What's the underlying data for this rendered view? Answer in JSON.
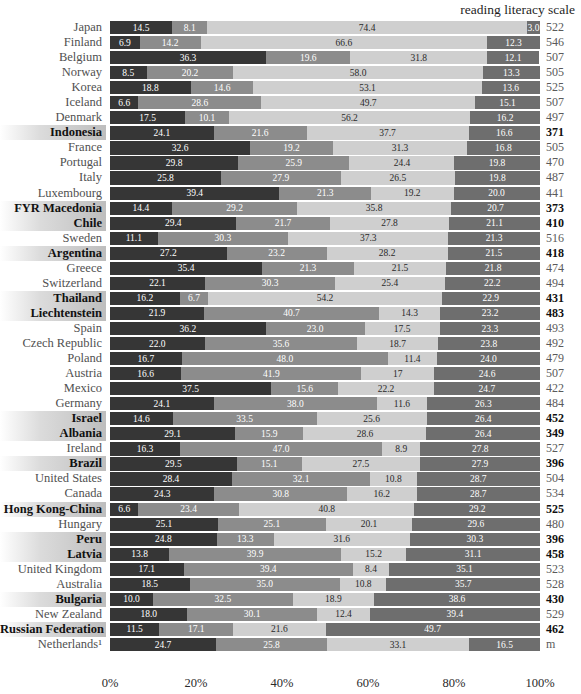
{
  "header": {
    "clipped_top_line": "————————",
    "scale_caption": "reading literacy scale"
  },
  "axis": {
    "ticks": [
      "0%",
      "20%",
      "40%",
      "60%",
      "80%",
      "100%"
    ],
    "tick_positions": [
      0,
      20,
      40,
      60,
      80,
      100
    ]
  },
  "colors": {
    "segment_1": "#363636",
    "segment_2": "#8c8c8c",
    "segment_3": "#cfcfcf",
    "segment_4": "#6e6e6e",
    "highlight_background": "#b2b2b2",
    "label_text": "#505050",
    "score_text": "#5a5a5a"
  },
  "chart_data": {
    "type": "bar",
    "subtype": "stacked-horizontal-100percent",
    "title": "",
    "xlabel": "",
    "ylabel": "",
    "xlim": [
      0,
      100
    ],
    "grid": true,
    "legend_position": "none",
    "categories": [
      "Japan",
      "Finland",
      "Belgium",
      "Norway",
      "Korea",
      "Iceland",
      "Denmark",
      "Indonesia",
      "France",
      "Portugal",
      "Italy",
      "Luxembourg",
      "FYR Macedonia",
      "Chile",
      "Sweden",
      "Argentina",
      "Greece",
      "Switzerland",
      "Thailand",
      "Liechtenstein",
      "Spain",
      "Czech Republic",
      "Poland",
      "Austria",
      "Mexico",
      "Germany",
      "Israel",
      "Albania",
      "Ireland",
      "Brazil",
      "United States",
      "Canada",
      "Hong Kong-China",
      "Hungary",
      "Peru",
      "Latvia",
      "United Kingdom",
      "Australia",
      "Bulgaria",
      "New Zealand",
      "Russian Federation",
      "Netherlands¹"
    ],
    "series": [
      {
        "name": "segment-1",
        "values": [
          14.5,
          6.9,
          36.3,
          8.5,
          18.8,
          6.6,
          17.5,
          24.1,
          32.6,
          29.8,
          25.8,
          39.4,
          14.4,
          29.4,
          11.1,
          27.2,
          35.4,
          22.1,
          16.2,
          21.9,
          36.2,
          22.0,
          16.7,
          16.6,
          37.5,
          24.1,
          14.6,
          29.1,
          16.3,
          29.5,
          28.4,
          24.3,
          6.6,
          25.1,
          24.8,
          13.8,
          17.1,
          18.5,
          10.0,
          18.0,
          11.5,
          24.7
        ]
      },
      {
        "name": "segment-2",
        "values": [
          8.1,
          14.2,
          19.6,
          20.2,
          14.6,
          28.6,
          10.1,
          21.6,
          19.2,
          25.9,
          27.9,
          21.3,
          29.2,
          21.7,
          30.3,
          23.2,
          21.3,
          30.3,
          6.7,
          40.7,
          23.0,
          35.6,
          48.0,
          41.9,
          15.6,
          38.0,
          33.5,
          15.9,
          47.0,
          15.1,
          32.1,
          30.8,
          23.4,
          25.1,
          13.3,
          39.9,
          39.4,
          35.0,
          32.5,
          30.1,
          17.1,
          25.8
        ]
      },
      {
        "name": "segment-3",
        "values": [
          74.4,
          66.6,
          31.8,
          58.0,
          53.1,
          49.7,
          56.2,
          37.7,
          31.3,
          24.4,
          26.5,
          19.2,
          35.8,
          27.8,
          37.3,
          28.2,
          21.5,
          25.4,
          54.2,
          14.3,
          17.5,
          18.7,
          11.4,
          17,
          22.2,
          11.6,
          25.6,
          28.6,
          8.9,
          27.5,
          10.8,
          16.2,
          40.8,
          20.1,
          31.6,
          15.2,
          8.4,
          10.8,
          18.9,
          12.4,
          21.6,
          33.1
        ]
      },
      {
        "name": "segment-4",
        "values": [
          3.0,
          12.3,
          12.1,
          13.3,
          13.6,
          15.1,
          16.2,
          16.6,
          16.8,
          19.8,
          19.8,
          20.0,
          20.7,
          21.1,
          21.3,
          21.5,
          21.8,
          22.2,
          22.9,
          23.2,
          23.3,
          23.8,
          24.0,
          24.6,
          24.7,
          26.3,
          26.4,
          26.4,
          27.8,
          27.9,
          28.7,
          28.7,
          29.2,
          29.6,
          30.3,
          31.1,
          35.1,
          35.7,
          38.6,
          39.4,
          49.7,
          16.5
        ]
      }
    ],
    "display_labels": {
      "segment_1": [
        "14.5",
        "6.9",
        "36.3",
        "8.5",
        "18.8",
        "6.6",
        "17.5",
        "24.1",
        "32.6",
        "29.8",
        "25.8",
        "39.4",
        "14.4",
        "29.4",
        "11.1",
        "27.2",
        "35.4",
        "22.1",
        "16.2",
        "21.9",
        "36.2",
        "22.0",
        "16.7",
        "16.6",
        "37.5",
        "24.1",
        "14.6",
        "29.1",
        "16.3",
        "29.5",
        "28.4",
        "24.3",
        "6.6",
        "25.1",
        "24.8",
        "13.8",
        "17.1",
        "18.5",
        "10.0",
        "18.0",
        "11.5",
        "24.7"
      ],
      "segment_2": [
        "8.1",
        "14.2",
        "19.6",
        "20.2",
        "14.6",
        "28.6",
        "10.1",
        "21.6",
        "19.2",
        "25.9",
        "27.9",
        "21.3",
        "29.2",
        "21.7",
        "30.3",
        "23.2",
        "21.3",
        "30.3",
        "6.7",
        "40.7",
        "23.0",
        "35.6",
        "48.0",
        "41.9",
        "15.6",
        "38.0",
        "33.5",
        "15.9",
        "47.0",
        "15.1",
        "32.1",
        "30.8",
        "23.4",
        "25.1",
        "13.3",
        "39.9",
        "39.4",
        "35.0",
        "32.5",
        "30.1",
        "17.1",
        "25.8"
      ],
      "segment_3": [
        "74.4",
        "66.6",
        "31.8",
        "58.0",
        "53.1",
        "49.7",
        "56.2",
        "37.7",
        "31.3",
        "24.4",
        "26.5",
        "19.2",
        "35.8",
        "27.8",
        "37.3",
        "28.2",
        "21.5",
        "25.4",
        "54.2",
        "14.3",
        "17.5",
        "18.7",
        "11.4",
        "17",
        "22.2",
        "11.6",
        "25.6",
        "28.6",
        "8.9",
        "27.5",
        "10.8",
        "16.2",
        "40.8",
        "20.1",
        "31.6",
        "15.2",
        "8.4",
        "10.8",
        "18.9",
        "12.4",
        "21.6",
        "33.1"
      ],
      "segment_4": [
        "3.0",
        "12.3",
        "12.1",
        "13.3",
        "13.6",
        "15.1",
        "16.2",
        "16.6",
        "16.8",
        "19.8",
        "19.8",
        "20.0",
        "20.7",
        "21.1",
        "21.3",
        "21.5",
        "21.8",
        "22.2",
        "22.9",
        "23.2",
        "23.3",
        "23.8",
        "24.0",
        "24.6",
        "24.7",
        "26.3",
        "26.4",
        "26.4",
        "27.8",
        "27.9",
        "28.7",
        "28.7",
        "29.2",
        "29.6",
        "30.3",
        "31.1",
        "35.1",
        "35.7",
        "38.6",
        "39.4",
        "49.7",
        "16.5"
      ]
    },
    "scores": [
      "522",
      "546",
      "507",
      "505",
      "525",
      "507",
      "497",
      "371",
      "505",
      "470",
      "487",
      "441",
      "373",
      "410",
      "516",
      "418",
      "474",
      "494",
      "431",
      "483",
      "493",
      "492",
      "479",
      "507",
      "422",
      "484",
      "452",
      "349",
      "527",
      "396",
      "504",
      "534",
      "525",
      "480",
      "396",
      "458",
      "523",
      "528",
      "430",
      "529",
      "462",
      "m"
    ],
    "highlighted": [
      false,
      false,
      false,
      false,
      false,
      false,
      false,
      true,
      false,
      false,
      false,
      false,
      true,
      true,
      false,
      true,
      false,
      false,
      true,
      true,
      false,
      false,
      false,
      false,
      false,
      false,
      true,
      true,
      false,
      true,
      false,
      false,
      true,
      false,
      true,
      true,
      false,
      false,
      true,
      false,
      true,
      false
    ]
  }
}
